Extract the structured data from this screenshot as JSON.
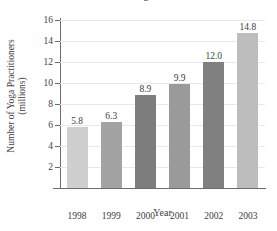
{
  "chart_data": {
    "type": "bar",
    "title": "Number of U.S. Yoga Practitioners",
    "xlabel": "Year",
    "ylabel_line1": "Number of Yoga Practitioners",
    "ylabel_line2": "(millions)",
    "categories": [
      "1998",
      "1999",
      "2000",
      "2001",
      "2002",
      "2003"
    ],
    "values": [
      5.8,
      6.3,
      8.9,
      9.9,
      12.0,
      14.8
    ],
    "value_labels": [
      "5.8",
      "6.3",
      "8.9",
      "9.9",
      "12.0",
      "14.8"
    ],
    "bar_colors": [
      "#cfcfcf",
      "#a3a3a3",
      "#7d7d7d",
      "#9a9a9a",
      "#808080",
      "#bdbdbd"
    ],
    "ylim": [
      0,
      16
    ],
    "yticks": [
      2,
      4,
      6,
      8,
      10,
      12,
      14,
      16
    ],
    "ytick_labels": [
      "2",
      "4",
      "6",
      "8",
      "10",
      "12",
      "14",
      "16"
    ],
    "grid": true,
    "legend": "none",
    "axis_color": "#6b6b6b",
    "grid_color": "#e9e9e9",
    "text_color": "#3d3d3d"
  }
}
